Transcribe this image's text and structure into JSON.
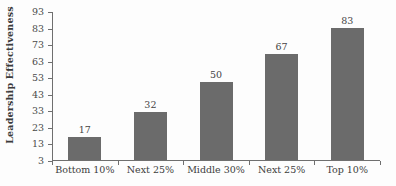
{
  "chart_data": {
    "type": "bar",
    "title": "",
    "subtitle": "",
    "xlabel": "",
    "ylabel": "Leadership Effectiveness",
    "categories": [
      "Bottom 10%",
      "Next 25%",
      "Middle 30%",
      "Next 25%",
      "Top 10%"
    ],
    "values": [
      17,
      32,
      50,
      67,
      83
    ],
    "data_labels": [
      "17",
      "32",
      "50",
      "67",
      "83"
    ],
    "ylim": [
      3,
      93
    ],
    "y_ticks": [
      3,
      13,
      23,
      33,
      43,
      53,
      63,
      73,
      83,
      93
    ],
    "y_tick_labels": [
      "3",
      "13",
      "23",
      "33",
      "43",
      "53",
      "63",
      "73",
      "83",
      "93"
    ],
    "grid": false,
    "legend": false,
    "legend_position": "none",
    "bar_color": "#6b6b6b",
    "axis_color": "#6f6f6f",
    "background_color": "#fdfdfd",
    "text_color": "#3c3c3c"
  }
}
